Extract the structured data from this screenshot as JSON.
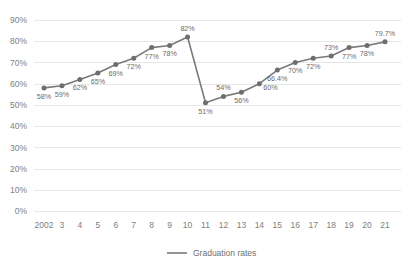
{
  "chart_data": {
    "type": "line",
    "title": "",
    "subtitle": "",
    "xlabel": "",
    "ylabel": "",
    "ylim": [
      0,
      90
    ],
    "grid": true,
    "legend_position": "bottom-center",
    "categories": [
      "2002",
      "3",
      "4",
      "5",
      "6",
      "7",
      "8",
      "9",
      "10",
      "11",
      "12",
      "13",
      "14",
      "15",
      "16",
      "17",
      "18",
      "19",
      "20",
      "21"
    ],
    "ytick_labels": [
      "90%",
      "80%",
      "70%",
      "60%",
      "50%",
      "40%",
      "30%",
      "20%",
      "10%",
      "0%"
    ],
    "ytick_values": [
      90,
      80,
      70,
      60,
      50,
      40,
      30,
      20,
      10,
      0
    ],
    "series": [
      {
        "name": "Graduation rates",
        "color": "#7a7a7a",
        "values": [
          58,
          59,
          62,
          65,
          69,
          72,
          77,
          78,
          82,
          51,
          54,
          56,
          60,
          66.4,
          70,
          72,
          73,
          77,
          78,
          79.7
        ],
        "data_labels": [
          "58%",
          "59%",
          "62%",
          "65%",
          "69%",
          "72%",
          "77%",
          "78%",
          "82%",
          "51%",
          "54%",
          "56%",
          "60%",
          "66.4%",
          "70%",
          "72%",
          "73%",
          "77%",
          "78%",
          "79.7%"
        ],
        "label_positions": [
          "below",
          "below",
          "below",
          "below",
          "below",
          "below",
          "below",
          "below",
          "above",
          "below",
          "above",
          "below",
          "right-below",
          "below",
          "below",
          "below",
          "above",
          "below",
          "below",
          "above"
        ]
      }
    ],
    "legend": [
      {
        "label": "Graduation rates",
        "color": "#7a7a7a",
        "marker": "line"
      }
    ],
    "colors": {
      "series": "#7a7a7a",
      "marker": "#6e6e6e",
      "gridline": "#e6e6e6",
      "axis_text": "#808080",
      "data_label_text": "#6b6b6b",
      "background": "#ffffff"
    }
  }
}
